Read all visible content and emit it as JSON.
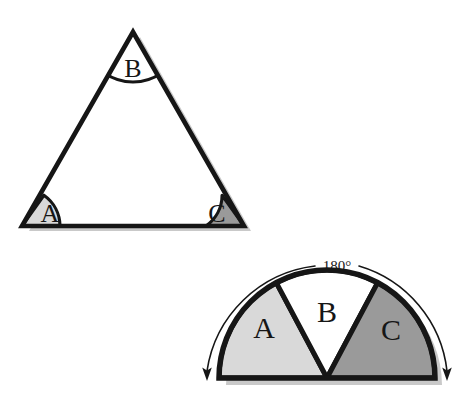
{
  "figure": {
    "background_color": "#ffffff",
    "stroke_color": "#161616",
    "shadow_color": "#c9c9c9",
    "colors": {
      "angle_a_fill": "#d9d9d9",
      "angle_b_fill": "#ffffff",
      "angle_c_fill": "#9a9a9a",
      "outline": "#161616",
      "shadow": "#c9c9c9",
      "page_background": "#ffffff"
    },
    "triangle": {
      "name": "triangle-figure",
      "outline_color": "#161616",
      "fill_color": "#ffffff",
      "vertices": {
        "apex": [
          133,
          32
        ],
        "bottom_left": [
          22,
          226
        ],
        "bottom_right": [
          244,
          226
        ]
      },
      "angles": [
        {
          "label": "A",
          "vertex": "bottom_left",
          "fill": "#d9d9d9",
          "label_x": 50,
          "label_y": 222
        },
        {
          "label": "B",
          "vertex": "apex",
          "fill": "#ffffff",
          "label_x": 133,
          "label_y": 77
        },
        {
          "label": "C",
          "vertex": "bottom_right",
          "fill": "#9a9a9a",
          "label_x": 217,
          "label_y": 222
        }
      ]
    },
    "semicircle": {
      "name": "semicircle-figure",
      "center": [
        327,
        378
      ],
      "radius": 108,
      "measure_label": "180°",
      "measure_label_x": 337,
      "measure_label_y": 268,
      "arrow_description": "double-headed arc arrow spanning the semicircle",
      "sectors": [
        {
          "label": "A",
          "fill": "#d9d9d9",
          "start_angle_deg": 180,
          "end_angle_deg": 118,
          "label_x": 264,
          "label_y": 338
        },
        {
          "label": "B",
          "fill": "#ffffff",
          "start_angle_deg": 118,
          "end_angle_deg": 62,
          "label_x": 327,
          "label_y": 322
        },
        {
          "label": "C",
          "fill": "#9a9a9a",
          "start_angle_deg": 62,
          "end_angle_deg": 0,
          "label_x": 391,
          "label_y": 340
        }
      ]
    }
  }
}
